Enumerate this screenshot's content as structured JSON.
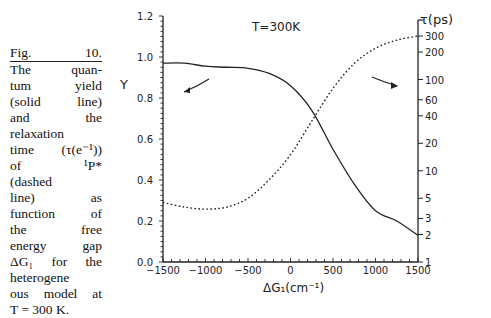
{
  "caption": {
    "lines": [
      "Fig. 10.",
      "The quan-",
      "tum yield",
      "(solid line)",
      "and the",
      "relaxation",
      "time (τ(e⁻¹))",
      "of ¹P*",
      "(dashed",
      "line) as",
      "function of",
      "the free",
      "energy gap",
      "ΔG₁ for the",
      "heterogene",
      "ous model at",
      "T = 300 K."
    ]
  },
  "chart_data": {
    "type": "line",
    "title": "T=300K",
    "xlabel": "ΔG₁(cm⁻¹)",
    "ylabel_left": "Y",
    "ylabel_right": "τ(ps)",
    "xlim": [
      -1500,
      1500
    ],
    "ylim_left": [
      0.0,
      1.2
    ],
    "ylim_right_log": [
      1,
      300
    ],
    "x_ticks": [
      "-1500",
      "-1000",
      "-500",
      "0",
      "500",
      "1000",
      "1500"
    ],
    "y_left_ticks": [
      "0.0",
      "0.2",
      "0.4",
      "0.6",
      "0.8",
      "1.0",
      "1.2"
    ],
    "y_right_ticks": [
      "1",
      "2",
      "3",
      "5",
      "10",
      "20",
      "40",
      "60",
      "100",
      "200",
      "300"
    ],
    "grid": false,
    "series": [
      {
        "name": "Quantum yield (solid line)",
        "axis": "left",
        "style": "solid",
        "x": [
          -1500,
          -1250,
          -1000,
          -750,
          -500,
          -250,
          0,
          250,
          500,
          750,
          1000,
          1250,
          1500
        ],
        "values": [
          0.97,
          0.97,
          0.955,
          0.95,
          0.945,
          0.92,
          0.86,
          0.74,
          0.55,
          0.38,
          0.25,
          0.2,
          0.13
        ]
      },
      {
        "name": "Relaxation time τ(e⁻¹) of ¹P* (dashed line)",
        "axis": "right",
        "style": "dashed",
        "x": [
          -1500,
          -1250,
          -1000,
          -750,
          -500,
          -250,
          0,
          250,
          500,
          750,
          1000,
          1250,
          1500
        ],
        "values": [
          4.5,
          4.0,
          3.8,
          4.0,
          5.0,
          8.0,
          15,
          35,
          80,
          150,
          220,
          270,
          300
        ]
      }
    ],
    "annotations": [
      "arrow from solid curve pointing to left axis",
      "arrow from dashed curve pointing to right axis"
    ]
  }
}
